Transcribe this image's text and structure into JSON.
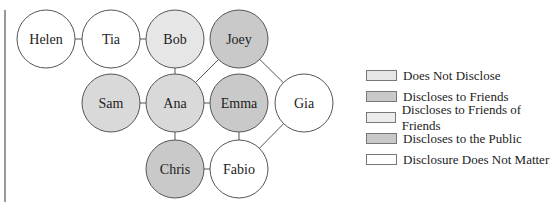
{
  "nodes": [
    {
      "id": "helen",
      "label": "Helen",
      "x": 46,
      "y": 39,
      "fill": "#ffffff"
    },
    {
      "id": "tia",
      "label": "Tia",
      "x": 111,
      "y": 39,
      "fill": "#ffffff"
    },
    {
      "id": "bob",
      "label": "Bob",
      "x": 175,
      "y": 39,
      "fill": "#e6e6e6"
    },
    {
      "id": "joey",
      "label": "Joey",
      "x": 239,
      "y": 39,
      "fill": "#c9c9c9"
    },
    {
      "id": "sam",
      "label": "Sam",
      "x": 111,
      "y": 103,
      "fill": "#d9d9d9"
    },
    {
      "id": "ana",
      "label": "Ana",
      "x": 175,
      "y": 103,
      "fill": "#d9d9d9"
    },
    {
      "id": "emma",
      "label": "Emma",
      "x": 239,
      "y": 103,
      "fill": "#c9c9c9"
    },
    {
      "id": "gia",
      "label": "Gia",
      "x": 304,
      "y": 103,
      "fill": "#ffffff"
    },
    {
      "id": "chris",
      "label": "Chris",
      "x": 175,
      "y": 169,
      "fill": "#c9c9c9"
    },
    {
      "id": "fabio",
      "label": "Fabio",
      "x": 239,
      "y": 169,
      "fill": "#ffffff"
    }
  ],
  "edges": [
    [
      "helen",
      "tia"
    ],
    [
      "tia",
      "bob"
    ],
    [
      "bob",
      "ana"
    ],
    [
      "ana",
      "joey"
    ],
    [
      "joey",
      "gia"
    ],
    [
      "sam",
      "ana"
    ],
    [
      "ana",
      "emma"
    ],
    [
      "ana",
      "chris"
    ],
    [
      "emma",
      "fabio"
    ],
    [
      "chris",
      "fabio"
    ],
    [
      "fabio",
      "gia"
    ]
  ],
  "legend": [
    {
      "label": "Does Not Disclose",
      "color": "#e6e6e6"
    },
    {
      "label": "Discloses to Friends",
      "color": "#c9c9c9"
    },
    {
      "label": "Discloses to Friends of Friends",
      "color": "#ececec"
    },
    {
      "label": "Discloses to the Public",
      "color": "#c9c9c9"
    },
    {
      "label": "Disclosure Does Not Matter",
      "color": "#ffffff"
    }
  ]
}
